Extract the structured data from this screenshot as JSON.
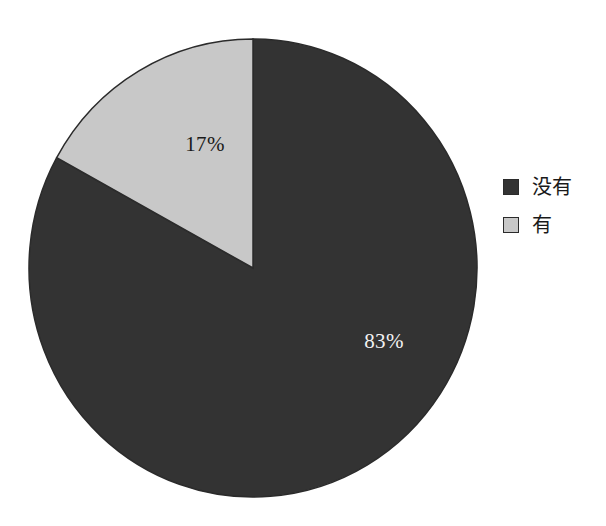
{
  "chart_data": {
    "type": "pie",
    "title": "",
    "subtitle": "",
    "categories": [
      "没有",
      "有"
    ],
    "values": [
      83,
      17
    ],
    "value_unit": "%",
    "data_labels": [
      "83%",
      "17%"
    ],
    "colors": [
      "#333333",
      "#c8c8c8"
    ],
    "label_text_colors": [
      "#f2f2f2",
      "#1a1a1a"
    ],
    "slice_border_color": "#2b2b2b",
    "start_angle_deg": 0,
    "direction": "clockwise",
    "legend": {
      "position": "right",
      "entries": [
        {
          "label": "没有",
          "color": "#333333",
          "value": 83
        },
        {
          "label": "有",
          "color": "#c8c8c8",
          "value": 17
        }
      ]
    },
    "background": "#ffffff",
    "grid": false,
    "axes": false
  },
  "geometry": {
    "center_x": 253,
    "center_y": 268,
    "radius_x": 224,
    "radius_y": 229,
    "label_83_x": 384,
    "label_83_y": 348,
    "label_17_x": 205,
    "label_17_y": 143
  }
}
